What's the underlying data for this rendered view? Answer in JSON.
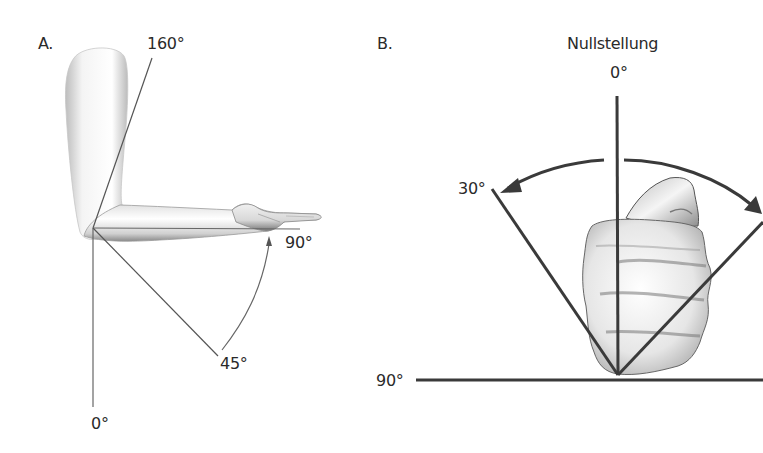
{
  "figure": {
    "panel_a": {
      "label": "A.",
      "subject": "elbow flexion/extension, arm in lateral view",
      "angles": {
        "top": "160°",
        "horizontal": "90°",
        "diagonal": "45°",
        "bottom": "0°"
      }
    },
    "panel_b": {
      "label": "B.",
      "title": "Nullstellung",
      "subject": "forearm pronation/supination, fist front view",
      "angles": {
        "vertical": "0°",
        "left": "30°",
        "horizontal": "90°"
      }
    },
    "colors": {
      "line": "#3a3a3a",
      "thin_line": "#555555",
      "text": "#2a2a2a",
      "background": "#ffffff"
    }
  }
}
